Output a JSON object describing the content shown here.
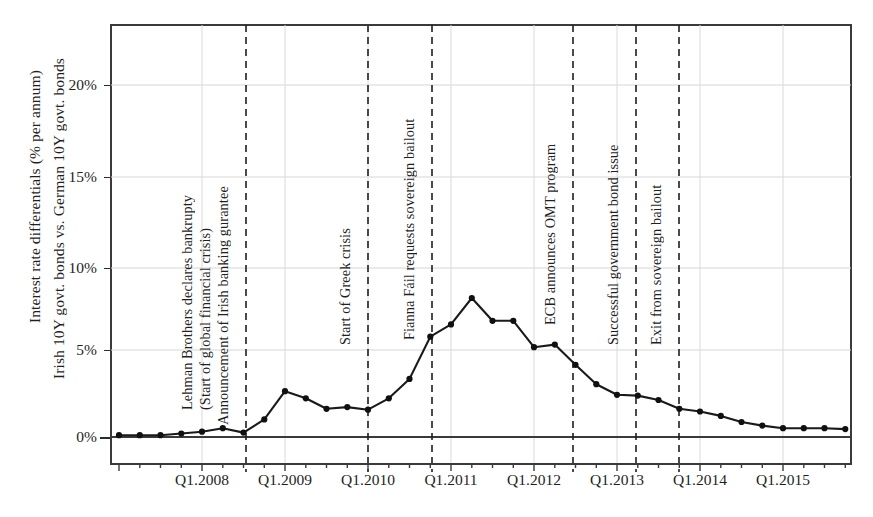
{
  "chart_data": {
    "type": "line",
    "title": "",
    "subtitle": "",
    "xlabel": "",
    "ylabel": "Interest rate differentials (% per annum) Irish 10Y govt. bonds vs. German 10Y govt. bonds",
    "ylabel_lines": [
      "Interest rate differentials (% per annum)",
      "Irish 10Y govt. bonds vs. German 10Y govt. bonds"
    ],
    "ylim": [
      -1.5,
      23.0
    ],
    "yticks": [
      0,
      5,
      10,
      15,
      20
    ],
    "ytick_labels": [
      "0%",
      "5%",
      "10%",
      "15%",
      "20%"
    ],
    "xlim": [
      "Q1.2007",
      "Q4.2015"
    ],
    "xticks": [
      "Q1.2008",
      "Q1.2009",
      "Q1.2010",
      "Q1.2011",
      "Q1.2012",
      "Q1.2013",
      "Q1.2014",
      "Q1.2015"
    ],
    "xtick_labels": [
      "Q1.2008",
      "Q1.2009",
      "Q1.2010",
      "Q1.2011",
      "Q1.2012",
      "Q1.2013",
      "Q1.2014",
      "Q1.2015"
    ],
    "grid": true,
    "legend": "none",
    "line_color": "#1a1a1a",
    "marker": "circle",
    "x": [
      "Q1.2007",
      "Q2.2007",
      "Q3.2007",
      "Q4.2007",
      "Q1.2008",
      "Q2.2008",
      "Q3.2008",
      "Q4.2008",
      "Q1.2009",
      "Q2.2009",
      "Q3.2009",
      "Q4.2009",
      "Q1.2010",
      "Q2.2010",
      "Q3.2010",
      "Q4.2010",
      "Q1.2011",
      "Q2.2011",
      "Q3.2011",
      "Q4.2011",
      "Q1.2012",
      "Q2.2012",
      "Q3.2012",
      "Q4.2012",
      "Q1.2013",
      "Q2.2013",
      "Q3.2013",
      "Q4.2013",
      "Q1.2014",
      "Q2.2014",
      "Q3.2014",
      "Q4.2014",
      "Q1.2015",
      "Q2.2015",
      "Q3.2015",
      "Q4.2015"
    ],
    "values": [
      0.1,
      0.1,
      0.1,
      0.2,
      0.3,
      0.5,
      0.25,
      1.0,
      2.6,
      2.2,
      1.6,
      1.7,
      1.55,
      2.2,
      3.3,
      5.7,
      6.4,
      7.9,
      6.6,
      6.6,
      5.1,
      5.25,
      4.1,
      3.0,
      2.4,
      2.35,
      2.1,
      1.6,
      1.45,
      1.2,
      0.85,
      0.65,
      0.5,
      0.5,
      0.5,
      0.45
    ],
    "annotations": [
      {
        "label": "Lehman Brothers declares bankrupty",
        "x": "Q3.2008",
        "kind": "text-only"
      },
      {
        "label": "(Start of global financial crisis)",
        "x": "Q3.2008",
        "kind": "text-only"
      },
      {
        "label": "Announcement of Irish banking gurantee",
        "x": "Q4.2008",
        "kind": "dashed-line"
      },
      {
        "label": "Start of Greek crisis",
        "x": "Q1.2010",
        "kind": "dashed-line"
      },
      {
        "label": "Fianna Fáil requests sovereign bailout",
        "x": "Q4.2010",
        "kind": "dashed-line"
      },
      {
        "label": "ECB announces OMT program",
        "x": "Q3.2012",
        "kind": "dashed-line"
      },
      {
        "label": "Successful government bond issue",
        "x": "Q1.2013",
        "kind": "dashed-line"
      },
      {
        "label": "Exit from sovereign bailout",
        "x": "Q4.2013",
        "kind": "dashed-line"
      }
    ]
  }
}
